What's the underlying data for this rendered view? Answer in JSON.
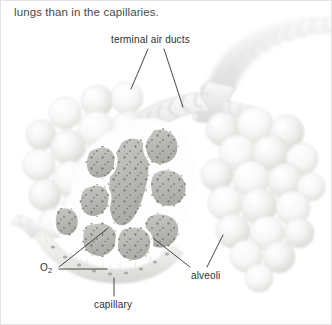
{
  "page": {
    "body_text": "lungs than in the capillaries.",
    "background_color": "#ffffff",
    "border_color": "#e3e3e3",
    "width": 332,
    "height": 325
  },
  "figure": {
    "name": "alveoli-and-capillary-diagram",
    "palette": {
      "alveoli_sphere_light": "#fbfbfb",
      "alveoli_sphere_shade": "#dcdcda",
      "cutaway_fill": "#bdbdb8",
      "cutaway_fill_dark": "#a9a9a4",
      "stipple_dot": "#6e6e6a",
      "septal_wall": "#ffffff",
      "duct_ring": "#e6e6e6",
      "duct_outline": "#d2d2d2",
      "capillary_fill": "#ececea",
      "leader_line": "#333333",
      "label_text": "#2f2f2f"
    },
    "labels": [
      {
        "id": "terminal-air-ducts",
        "text": "terminal air ducts",
        "x": 110,
        "y": 33,
        "leaders": [
          {
            "x1": 147,
            "y1": 48,
            "x2": 130,
            "y2": 88
          },
          {
            "x1": 163,
            "y1": 48,
            "x2": 182,
            "y2": 106
          }
        ]
      },
      {
        "id": "alveoli",
        "text": "alveoli",
        "x": 190,
        "y": 269,
        "leaders": [
          {
            "x1": 189,
            "y1": 267,
            "x2": 152,
            "y2": 237
          },
          {
            "x1": 205,
            "y1": 267,
            "x2": 222,
            "y2": 234
          }
        ]
      },
      {
        "id": "capillary",
        "text": "capillary",
        "x": 93,
        "y": 298,
        "leaders": [
          {
            "x1": 113,
            "y1": 296,
            "x2": 113,
            "y2": 277
          }
        ]
      },
      {
        "id": "o2",
        "text": "O",
        "subscript": "2",
        "x": 39,
        "y": 261,
        "leaders": [
          {
            "x1": 58,
            "y1": 266,
            "x2": 106,
            "y2": 228
          },
          {
            "x1": 58,
            "y1": 268,
            "x2": 106,
            "y2": 268
          }
        ]
      }
    ],
    "structures": [
      {
        "id": "main-duct-upper-right",
        "type": "ribbed-tube",
        "description": "large ribbed air duct entering from upper right"
      },
      {
        "id": "duct-branch-left",
        "type": "ribbed-tube",
        "description": "branch descending to the left alveolar cluster"
      },
      {
        "id": "duct-branch-center",
        "type": "ribbed-tube",
        "description": "branch descending to the central alveolar sac"
      },
      {
        "id": "alveolar-cluster-left",
        "type": "alveoli-cluster",
        "description": "intact spherical alveoli, left"
      },
      {
        "id": "alveolar-cluster-right",
        "type": "alveoli-cluster",
        "description": "intact spherical alveoli, right"
      },
      {
        "id": "alveolar-sac-cutaway",
        "type": "alveoli-cutaway",
        "description": "sectioned alveoli showing stippled interior"
      },
      {
        "id": "capillary-vessel",
        "type": "capillary",
        "description": "capillary running along the base of the cut alveoli"
      }
    ]
  }
}
